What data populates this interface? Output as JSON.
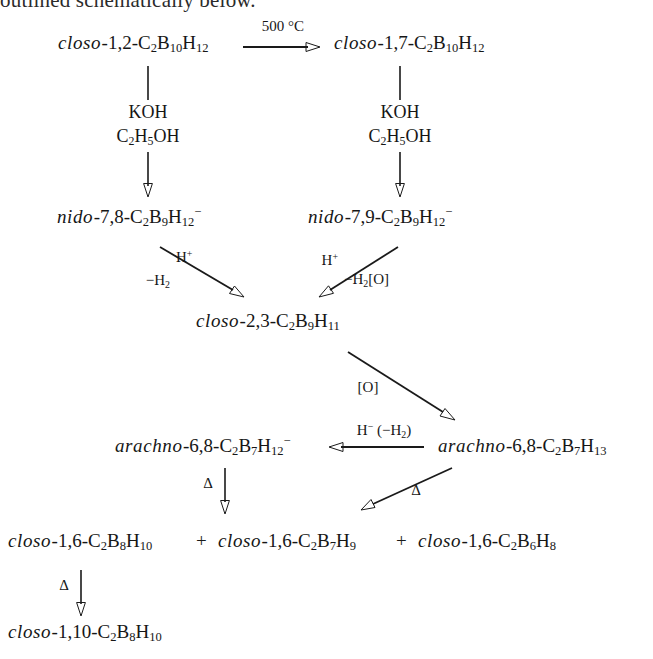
{
  "header": {
    "text": "outlined schematically below."
  },
  "scheme": {
    "title": "Carborane interconversion reaction scheme",
    "species": {
      "closo_1_2_C2B10H12": {
        "prefix": "closo",
        "rest": "-1,2-C",
        "parts": "C2B10H12"
      },
      "closo_1_7_C2B10H12": {
        "prefix": "closo",
        "rest": "-1,7-C",
        "parts": "C2B10H12"
      },
      "nido_7_8_C2B9H12": {
        "prefix": "nido",
        "rest": "-7,8-C",
        "parts": "C2B9H12-"
      },
      "nido_7_9_C2B9H12": {
        "prefix": "nido",
        "rest": "-7,9-C",
        "parts": "C2B9H12-"
      },
      "closo_2_3_C2B9H11": {
        "prefix": "closo",
        "rest": "-2,3-C",
        "parts": "C2B9H11"
      },
      "arachno_6_8_C2B7H12": {
        "prefix": "arachno",
        "rest": "-6,8-C",
        "parts": "C2B7H12-"
      },
      "arachno_6_8_C2B7H13": {
        "prefix": "arachno",
        "rest": "-6,8-C",
        "parts": "C2B7H13"
      },
      "closo_1_6_C2B8H10": {
        "prefix": "closo",
        "rest": "-1,6-C",
        "parts": "C2B8H10"
      },
      "closo_1_6_C2B7H9": {
        "prefix": "closo",
        "rest": "-1,6-C",
        "parts": "C2B7H9"
      },
      "closo_1_6_C2B6H8": {
        "prefix": "closo",
        "rest": "-1,6-C",
        "parts": "C2B6H8"
      },
      "closo_1_10_C2B8H10": {
        "prefix": "closo",
        "rest": "-1,10-C",
        "parts": "C2B8H10"
      }
    },
    "labels": {
      "temperature": "500 °C",
      "koh": "KOH",
      "ethanol_c": "C",
      "oxidant": "[O]",
      "delta": "Δ",
      "plus": "+",
      "minus_h2": "−H",
      "h_plus": "H",
      "minus_h2_o": "−H",
      "hydride": "H",
      "hydride_paren": "(−H",
      "hydride_paren_close": ")"
    },
    "colors": {
      "ink": "#1a1a1a",
      "background": "#ffffff"
    }
  }
}
